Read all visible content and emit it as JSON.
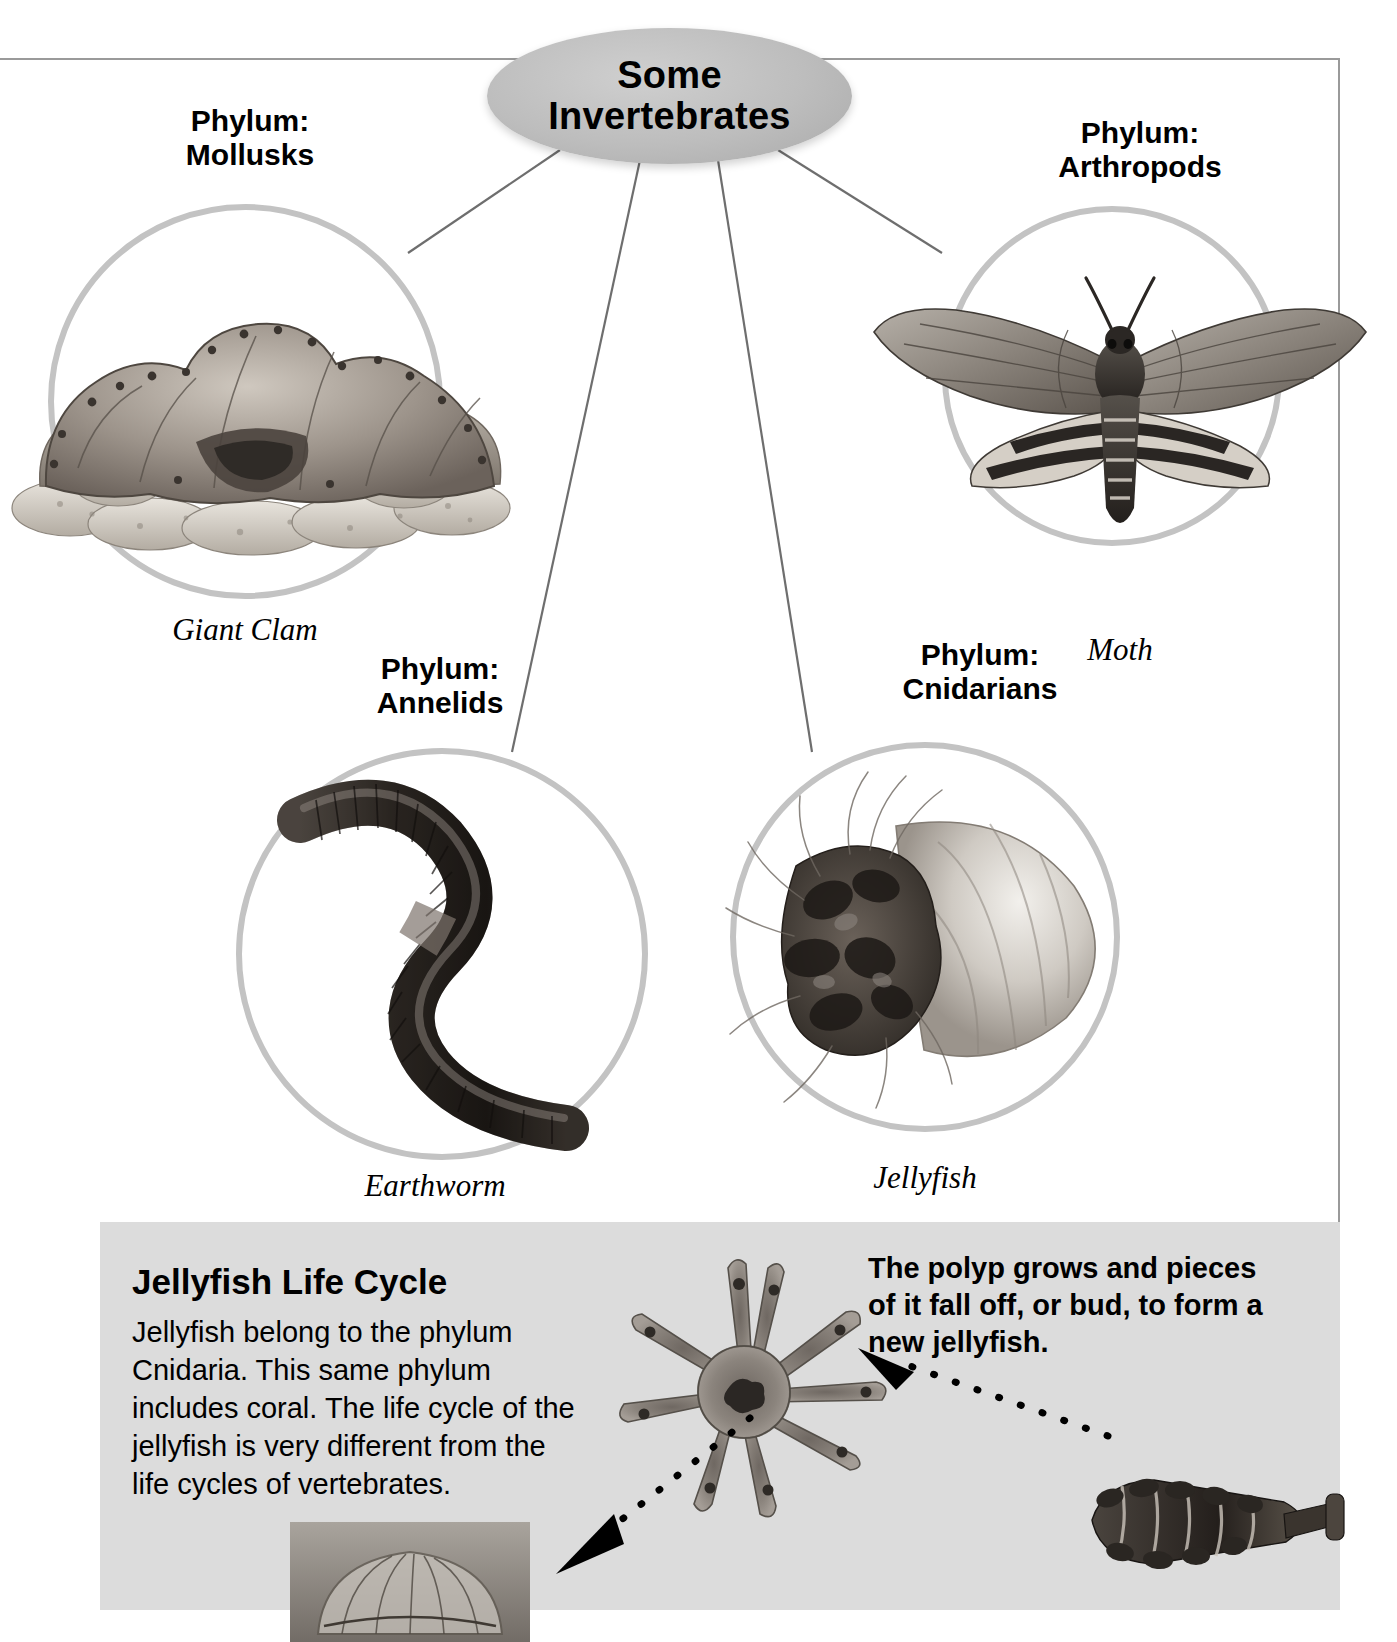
{
  "diagram": {
    "type": "concept-map",
    "center": {
      "line1": "Some",
      "line2": "Invertebrates"
    },
    "branches": [
      {
        "id": "mollusks",
        "phylum": "Phylum:\nMollusks",
        "specimen": "Giant Clam",
        "icon": "giant-clam-photo"
      },
      {
        "id": "arthropods",
        "phylum": "Phylum:\nArthropods",
        "specimen": "Moth",
        "icon": "moth-photo"
      },
      {
        "id": "annelids",
        "phylum": "Phylum:\nAnnelids",
        "specimen": "Earthworm",
        "icon": "earthworm-photo"
      },
      {
        "id": "cnidarians",
        "phylum": "Phylum:\nCnidarians",
        "specimen": "Jellyfish",
        "icon": "jellyfish-photo"
      }
    ]
  },
  "panel": {
    "heading": "Jellyfish Life Cycle",
    "body": "Jellyfish belong to the phylum Cnidaria. This same phylum includes coral. The life cycle of the jellyfish is very different from the life cycles of vertebrates.",
    "note": "The polyp grows and pieces of it fall off, or bud, to form a new jellyfish.",
    "figures": [
      {
        "id": "polyp",
        "icon": "polyp-photo"
      },
      {
        "id": "strobila",
        "icon": "budding-polyp-photo"
      },
      {
        "id": "medusa",
        "icon": "young-jellyfish-photo"
      }
    ]
  },
  "colors": {
    "ring": "#c3c3c3",
    "bubble": "#bdbdbd",
    "panel": "#dcdcdc",
    "line": "#6e6e6e"
  }
}
